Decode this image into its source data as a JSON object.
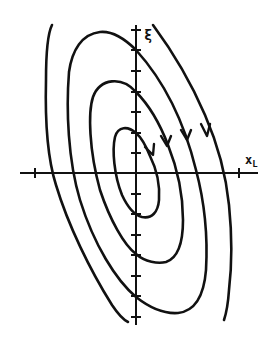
{
  "diagram": {
    "type": "phase-portrait",
    "axes": {
      "x_label": "x",
      "x_label_subscript": "L",
      "y_label": "ξ",
      "y_label_subscript": "I"
    },
    "orbits": [
      {
        "name": "inner-orbit",
        "closed": true
      },
      {
        "name": "middle-orbit",
        "closed": true
      },
      {
        "name": "outer-orbit",
        "closed": true
      },
      {
        "name": "outermost-trajectory",
        "closed": false
      }
    ],
    "arrow_direction": "clockwise",
    "colors": {
      "ink": "#111111",
      "background": "#ffffff"
    }
  }
}
